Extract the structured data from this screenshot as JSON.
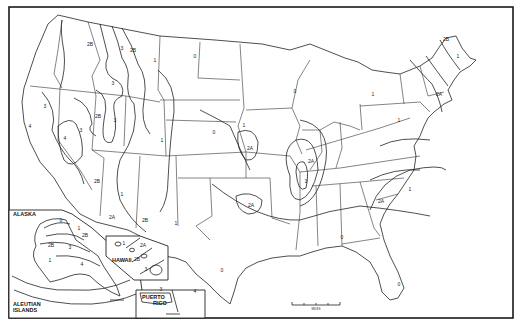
{
  "map": {
    "title": "Seismic Zone Map of the United States",
    "zone_values": [
      "0",
      "1",
      "2A",
      "2B",
      "3",
      "4"
    ],
    "regions": {
      "alaska": "ALASKA",
      "aleutian_1": "ALEUTIAN",
      "aleutian_2": "ISLANDS",
      "hawaii": "HAWAII",
      "puerto_1": "PUERTO",
      "puerto_2": "RICO"
    },
    "labels": [
      {
        "id": "wa-2b",
        "text": "2B",
        "x": 90,
        "y": 46
      },
      {
        "id": "id-3",
        "text": "3",
        "x": 122,
        "y": 50
      },
      {
        "id": "mt-2b",
        "text": "2B",
        "x": 133,
        "y": 52
      },
      {
        "id": "mt-1",
        "text": "1",
        "x": 155,
        "y": 62
      },
      {
        "id": "wy-3",
        "text": "3",
        "x": 113,
        "y": 85
      },
      {
        "id": "ca-3",
        "text": "3",
        "x": 45,
        "y": 108
      },
      {
        "id": "nv-2b",
        "text": "2B",
        "x": 98,
        "y": 118
      },
      {
        "id": "ut-3",
        "text": "3",
        "x": 115,
        "y": 122
      },
      {
        "id": "ca-4",
        "text": "4",
        "x": 30,
        "y": 128
      },
      {
        "id": "nv-5",
        "text": "3",
        "x": 81,
        "y": 132
      },
      {
        "id": "nv-4",
        "text": "4",
        "x": 65,
        "y": 140
      },
      {
        "id": "co-1",
        "text": "1",
        "x": 162,
        "y": 142
      },
      {
        "id": "nd-0",
        "text": "0",
        "x": 195,
        "y": 58
      },
      {
        "id": "wi-0",
        "text": "0",
        "x": 295,
        "y": 93
      },
      {
        "id": "ne-0",
        "text": "0",
        "x": 214,
        "y": 134
      },
      {
        "id": "ks-1",
        "text": "1",
        "x": 244,
        "y": 127
      },
      {
        "id": "ks-2a",
        "text": "2A",
        "x": 250,
        "y": 150
      },
      {
        "id": "ut-2b",
        "text": "2B",
        "x": 97,
        "y": 183
      },
      {
        "id": "az-1",
        "text": "1",
        "x": 122,
        "y": 196
      },
      {
        "id": "az-2a",
        "text": "2A",
        "x": 112,
        "y": 219
      },
      {
        "id": "nm-2b",
        "text": "2B",
        "x": 145,
        "y": 222
      },
      {
        "id": "nm-1",
        "text": "1",
        "x": 176,
        "y": 225
      },
      {
        "id": "ok-2a",
        "text": "2A",
        "x": 251,
        "y": 207
      },
      {
        "id": "il-2a",
        "text": "2A",
        "x": 311,
        "y": 163
      },
      {
        "id": "nm-3",
        "text": "3",
        "x": 306,
        "y": 183
      },
      {
        "id": "sc-2a",
        "text": "2A",
        "x": 381,
        "y": 203
      },
      {
        "id": "ga-0",
        "text": "0",
        "x": 342,
        "y": 239
      },
      {
        "id": "tx-0",
        "text": "0",
        "x": 222,
        "y": 272
      },
      {
        "id": "fl-0",
        "text": "0",
        "x": 399,
        "y": 286
      },
      {
        "id": "pa-1",
        "text": "1",
        "x": 399,
        "y": 122
      },
      {
        "id": "ny-2a",
        "text": "2A",
        "x": 439,
        "y": 96
      },
      {
        "id": "me-2b",
        "text": "2B",
        "x": 446,
        "y": 41
      },
      {
        "id": "me-1",
        "text": "1",
        "x": 458,
        "y": 58
      },
      {
        "id": "nc-1",
        "text": "1",
        "x": 410,
        "y": 191
      },
      {
        "id": "mi-1",
        "text": "1",
        "x": 373,
        "y": 96
      },
      {
        "id": "ak-0",
        "text": "0",
        "x": 61,
        "y": 222
      },
      {
        "id": "ak-1",
        "text": "1",
        "x": 79,
        "y": 230
      },
      {
        "id": "ak-2b",
        "text": "2B",
        "x": 85,
        "y": 237
      },
      {
        "id": "ak-2b-w",
        "text": "2B",
        "x": 51,
        "y": 247
      },
      {
        "id": "ak-3",
        "text": "3",
        "x": 70,
        "y": 249
      },
      {
        "id": "ak-1-w",
        "text": "1",
        "x": 50,
        "y": 262
      },
      {
        "id": "ak-4",
        "text": "4",
        "x": 82,
        "y": 266
      },
      {
        "id": "hi-1",
        "text": "1",
        "x": 124,
        "y": 245
      },
      {
        "id": "hi-2a",
        "text": "2A",
        "x": 143,
        "y": 247
      },
      {
        "id": "hi-2b",
        "text": "2B",
        "x": 137,
        "y": 261
      },
      {
        "id": "hi-3",
        "text": "3",
        "x": 146,
        "y": 271
      },
      {
        "id": "pr-3",
        "text": "3",
        "x": 161,
        "y": 291
      },
      {
        "id": "pr-4",
        "text": "4",
        "x": 195,
        "y": 293
      }
    ]
  },
  "scale_bar": {
    "label": "MILES"
  }
}
